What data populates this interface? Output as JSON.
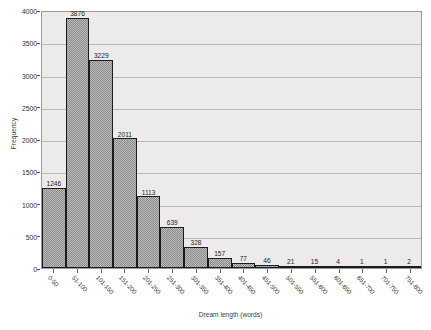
{
  "chart_data": {
    "type": "bar",
    "title": "",
    "xlabel": "Dream length (words)",
    "ylabel": "Frequency",
    "ylim": [
      0,
      4000
    ],
    "yticks": [
      0,
      500,
      1000,
      1500,
      2000,
      2500,
      3000,
      3500,
      4000
    ],
    "ytick_labels": [
      "0",
      "500",
      "1000",
      "1500",
      "2000",
      "2500",
      "3000",
      "3500",
      "4000"
    ],
    "grid": true,
    "legend": false,
    "categories": [
      "0-50",
      "51-100",
      "101-150",
      "151-200",
      "201-250",
      "251-300",
      "301-350",
      "351-400",
      "401-450",
      "451-500",
      "501-550",
      "551-600",
      "601-650",
      "651-700",
      "701-750",
      "751-800"
    ],
    "values": [
      1246,
      3876,
      3229,
      2011,
      1113,
      639,
      328,
      157,
      77,
      46,
      21,
      15,
      4,
      1,
      1,
      2
    ],
    "value_labels": [
      "1246",
      "3876",
      "3229",
      "2011",
      "1113",
      "639",
      "328",
      "157",
      "77",
      "46",
      "21",
      "15",
      "4",
      "1",
      "1",
      "2"
    ],
    "bar_color": "#b9b9b9",
    "bar_edge_color": "#1c1c1c",
    "plot_background": "#eceaea",
    "gridline_color": "#b9b9b9"
  }
}
